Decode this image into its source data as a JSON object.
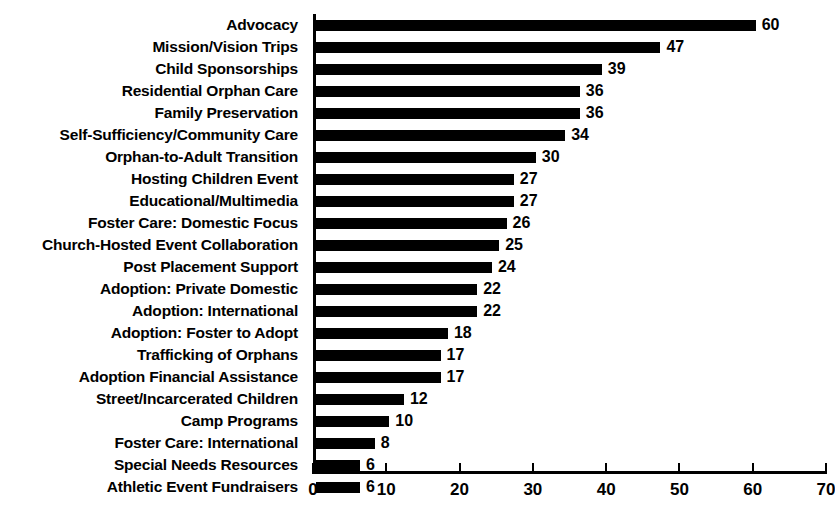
{
  "chart_data": {
    "type": "bar",
    "orientation": "horizontal",
    "title": "",
    "xlabel": "",
    "ylabel": "",
    "xlim": [
      0,
      70
    ],
    "xticks": [
      0,
      10,
      20,
      30,
      40,
      50,
      60,
      70
    ],
    "grid": false,
    "legend": false,
    "bar_color": "#000000",
    "background_color": "#ffffff",
    "text_color": "#000000",
    "show_value_labels": true,
    "categories": [
      "Advocacy",
      "Mission/Vision Trips",
      "Child Sponsorships",
      "Residential Orphan Care",
      "Family Preservation",
      "Self-Sufficiency/Community Care",
      "Orphan-to-Adult Transition",
      "Hosting Children Event",
      "Educational/Multimedia",
      "Foster Care: Domestic Focus",
      "Church-Hosted Event Collaboration",
      "Post Placement Support",
      "Adoption: Private Domestic",
      "Adoption: International",
      "Adoption: Foster to Adopt",
      "Trafficking of Orphans",
      "Adoption Financial Assistance",
      "Street/Incarcerated Children",
      "Camp Programs",
      "Foster Care: International",
      "Special Needs Resources",
      "Athletic Event Fundraisers"
    ],
    "values": [
      60,
      47,
      39,
      36,
      36,
      34,
      30,
      27,
      27,
      26,
      25,
      24,
      22,
      22,
      18,
      17,
      17,
      12,
      10,
      8,
      6,
      6
    ]
  }
}
